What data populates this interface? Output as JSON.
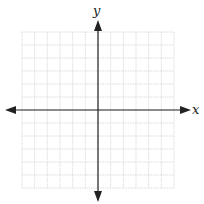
{
  "chart_data": {
    "type": "scatter",
    "title": "",
    "xlabel": "x",
    "ylabel": "y",
    "xlim": [
      -6,
      6
    ],
    "ylim": [
      -6,
      6
    ],
    "grid": true,
    "grid_step": 1,
    "series": [],
    "axes_arrows": true
  },
  "axes": {
    "x_label": "x",
    "y_label": "y"
  },
  "colors": {
    "grid": "#d6d6d6",
    "axis": "#222222"
  }
}
